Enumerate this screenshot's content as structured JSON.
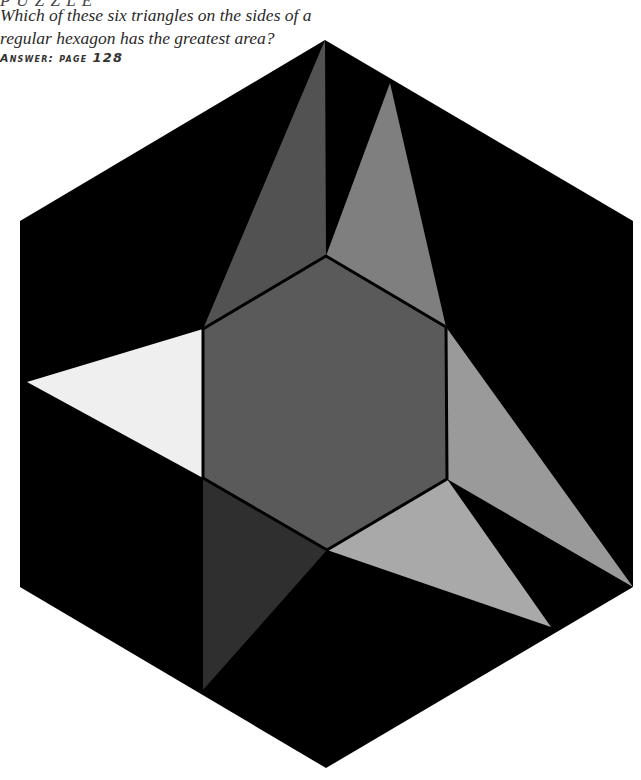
{
  "heading_partial": "P U Z Z L E",
  "question": {
    "line1": "Which of these six triangles on the sides of a",
    "line2": "regular hexagon has the greatest area?"
  },
  "answer": {
    "label": "Answer: page",
    "page": "128"
  },
  "figure": {
    "outer_hexagon": {
      "color": "#000000",
      "points": [
        [
          325,
          40
        ],
        [
          633,
          221
        ],
        [
          633,
          587
        ],
        [
          326,
          768
        ],
        [
          20,
          587
        ],
        [
          20,
          221
        ]
      ]
    },
    "inner_hexagon": {
      "color": "#5a5a5a",
      "stroke": "#000000",
      "points": [
        [
          326,
          256
        ],
        [
          446,
          327
        ],
        [
          447,
          479
        ],
        [
          327,
          550
        ],
        [
          203,
          478
        ],
        [
          203,
          329
        ]
      ]
    },
    "triangles": [
      {
        "id": "upper-left",
        "color": "#525252",
        "points": [
          [
            326,
            256
          ],
          [
            203,
            329
          ],
          [
            325,
            40
          ]
        ]
      },
      {
        "id": "upper-right",
        "color": "#7f7f7f",
        "points": [
          [
            326,
            256
          ],
          [
            446,
            327
          ],
          [
            390,
            83
          ]
        ]
      },
      {
        "id": "right",
        "color": "#9a9a9a",
        "points": [
          [
            446,
            327
          ],
          [
            447,
            479
          ],
          [
            633,
            587
          ]
        ]
      },
      {
        "id": "lower-right",
        "color": "#a9a9a9",
        "points": [
          [
            447,
            479
          ],
          [
            327,
            550
          ],
          [
            551,
            627
          ]
        ]
      },
      {
        "id": "lower-left",
        "color": "#2f2f2f",
        "points": [
          [
            327,
            550
          ],
          [
            203,
            478
          ],
          [
            203,
            690
          ]
        ]
      },
      {
        "id": "left",
        "color": "#efefef",
        "points": [
          [
            203,
            478
          ],
          [
            203,
            329
          ],
          [
            27,
            382
          ]
        ]
      }
    ]
  }
}
